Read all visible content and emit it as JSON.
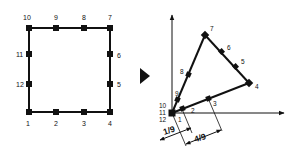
{
  "figure": {
    "left_panel": {
      "name": "square-element",
      "node_labels": [
        "1",
        "2",
        "3",
        "4",
        "5",
        "6",
        "7",
        "8",
        "9",
        "10",
        "11",
        "12"
      ]
    },
    "arrow": {
      "name": "transform-arrow",
      "glyph": "right-pointing-triangle"
    },
    "right_panel": {
      "name": "mapped-triangle-element",
      "node_labels": [
        "1",
        "2",
        "3",
        "4",
        "5",
        "6",
        "7",
        "8",
        "9",
        "10",
        "11",
        "12"
      ],
      "dimensions": [
        "1/9",
        "4/9"
      ]
    },
    "colors": {
      "stroke": "#111111",
      "background": "#ffffff"
    }
  }
}
